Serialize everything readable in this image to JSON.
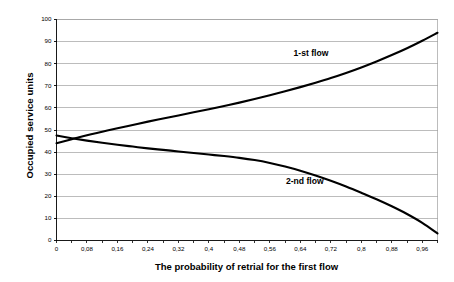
{
  "chart_data": {
    "type": "line",
    "title": "",
    "xlabel": "The probability of retrial for the first flow",
    "ylabel": "Occupied service units",
    "xlim": [
      0,
      1.0
    ],
    "ylim": [
      0,
      100
    ],
    "grid": true,
    "grid_axis": "y",
    "legend_position": "inline-annotation",
    "x_tick_labels": [
      "0",
      "0,08",
      "0,16",
      "0,24",
      "0,32",
      "0,4",
      "0,48",
      "0,56",
      "0,64",
      "0,72",
      "0,8",
      "0,88",
      "0,96"
    ],
    "x_tick_values": [
      0,
      0.08,
      0.16,
      0.24,
      0.32,
      0.4,
      0.48,
      0.56,
      0.64,
      0.72,
      0.8,
      0.88,
      0.96
    ],
    "y_tick_labels": [
      "0",
      "10",
      "20",
      "30",
      "40",
      "50",
      "60",
      "70",
      "80",
      "90",
      "100"
    ],
    "y_tick_values": [
      0,
      10,
      20,
      30,
      40,
      50,
      60,
      70,
      80,
      90,
      100
    ],
    "x": [
      0,
      0.04,
      0.08,
      0.12,
      0.16,
      0.2,
      0.24,
      0.28,
      0.32,
      0.36,
      0.4,
      0.44,
      0.48,
      0.52,
      0.56,
      0.6,
      0.64,
      0.68,
      0.72,
      0.76,
      0.8,
      0.84,
      0.88,
      0.92,
      0.96,
      1.0
    ],
    "series": [
      {
        "name": "1-st flow",
        "label": "1-st flow",
        "color": "#000000",
        "values": [
          44.0,
          45.8,
          47.6,
          49.2,
          50.8,
          52.3,
          53.8,
          55.2,
          56.6,
          58.0,
          59.4,
          60.9,
          62.4,
          64.0,
          65.7,
          67.5,
          69.4,
          71.4,
          73.5,
          75.8,
          78.3,
          81.0,
          83.9,
          87.0,
          90.4,
          94.0
        ],
        "annotation": {
          "x": 0.68,
          "y": 85
        }
      },
      {
        "name": "2-nd flow",
        "label": "2-nd flow",
        "color": "#000000",
        "values": [
          47.5,
          46.3,
          45.2,
          44.2,
          43.3,
          42.5,
          41.7,
          41.0,
          40.3,
          39.6,
          38.9,
          38.2,
          37.4,
          36.4,
          35.1,
          33.5,
          31.6,
          29.4,
          27.0,
          24.4,
          21.6,
          18.7,
          15.5,
          12.0,
          8.0,
          3.2
        ],
        "annotation": {
          "x": 0.66,
          "y": 27
        }
      }
    ],
    "axis_color": "#000000",
    "grid_color": "#a0a0a0",
    "background": "#ffffff"
  },
  "labels": {
    "ylabel": "Occupied service units",
    "xlabel": "The probability of retrial for the first flow",
    "series1": "1-st flow",
    "series2": "2-nd flow"
  }
}
